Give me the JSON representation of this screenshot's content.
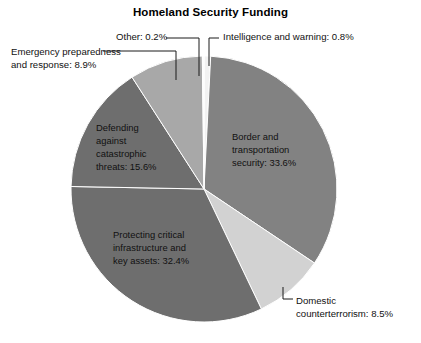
{
  "chart_data": {
    "type": "pie",
    "title": "Homeland Security Funding",
    "subtitle": "",
    "xlabel": "",
    "ylabel": "",
    "unit": "%",
    "legend_position": "none",
    "grid": false,
    "total": 99.99999,
    "start_angle_deg": 0,
    "direction": "clockwise",
    "categories": [
      "Intelligence and warning",
      "Border and transportation security",
      "Domestic counterterrorism",
      "Protecting critical infrastructure and key assets",
      "Defending against catastrophic threats",
      "Emergency preparedness and response",
      "Other"
    ],
    "values": [
      0.8,
      33.6,
      8.5,
      32.4,
      15.6,
      8.9,
      0.2
    ],
    "colors": [
      "#f2f2f2",
      "#828282",
      "#d2d2d2",
      "#6e6e6e",
      "#6e6e6e",
      "#a8a8a8",
      "#fbfbfb"
    ],
    "slices": [
      {
        "name": "Intelligence and warning",
        "value": 0.8,
        "label": "Intelligence and warning: 0.8%",
        "color": "#f2f2f2",
        "label_placement": "callout-outside-top-right"
      },
      {
        "name": "Border and transportation security",
        "value": 33.6,
        "label": "Border and\ntransportation\nsecurity: 33.6%",
        "color": "#828282",
        "label_placement": "inside-right"
      },
      {
        "name": "Domestic counterterrorism",
        "value": 8.5,
        "label": "Domestic\ncounterterrorism: 8.5%",
        "color": "#d2d2d2",
        "label_placement": "callout-outside-bottom-right"
      },
      {
        "name": "Protecting critical infrastructure and key assets",
        "value": 32.4,
        "label": "Protecting critical\ninfrastructure and\nkey assets: 32.4%",
        "color": "#6e6e6e",
        "label_placement": "inside-bottom-left"
      },
      {
        "name": "Defending against catastrophic threats",
        "value": 15.6,
        "label": "Defending\nagainst\ncatastrophic\nthreats: 15.6%",
        "color": "#6e6e6e",
        "label_placement": "inside-left"
      },
      {
        "name": "Emergency preparedness and response",
        "value": 8.9,
        "label": "Emergency preparedness\nand response: 8.9%",
        "color": "#a8a8a8",
        "label_placement": "callout-outside-top-left"
      },
      {
        "name": "Other",
        "value": 0.2,
        "label": "Other: 0.2%",
        "color": "#fbfbfb",
        "label_placement": "callout-outside-top-center"
      }
    ]
  },
  "geometry": {
    "center_x": 204,
    "center_y": 189,
    "radius": 133
  },
  "labels": {
    "other": "Other: 0.2%",
    "intelligence": "Intelligence and warning: 0.8%",
    "emergency": "Emergency preparedness\nand response: 8.9%",
    "domestic": "Domestic\ncounterterrorism: 8.5%",
    "defending": "Defending\nagainst\ncatastrophic\nthreats: 15.6%",
    "protecting": "Protecting critical\ninfrastructure and\nkey assets: 32.4%",
    "border": "Border and\ntransportation\nsecurity: 33.6%"
  }
}
